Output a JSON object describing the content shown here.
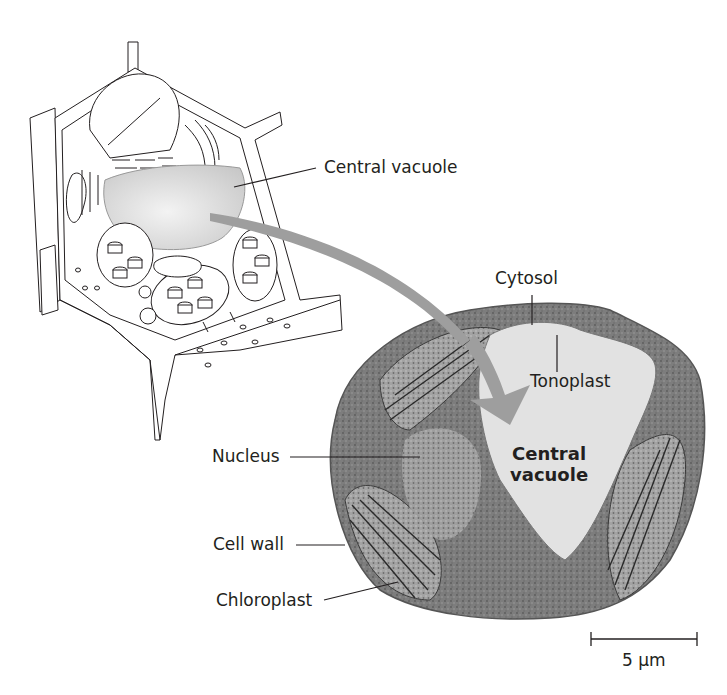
{
  "figure": {
    "type": "plant-cell-central-vacuole",
    "colors": {
      "background": "#ffffff",
      "line": "#231f20",
      "vacuole_fill": "#d9d9d9",
      "arrow": "#9e9e9e",
      "micrograph_cytoplasm": "#7a7a7a",
      "micrograph_vacuole": "#e2e2e2"
    }
  },
  "labels": {
    "central_vacuole_drawing": "Central vacuole",
    "cytosol": "Cytosol",
    "tonoplast": "Tonoplast",
    "nucleus": "Nucleus",
    "cell_wall": "Cell wall",
    "chloroplast": "Chloroplast",
    "central_vacuole_micrograph_line1": "Central",
    "central_vacuole_micrograph_line2": "vacuole"
  },
  "scale_bar": {
    "label": "5 µm"
  }
}
